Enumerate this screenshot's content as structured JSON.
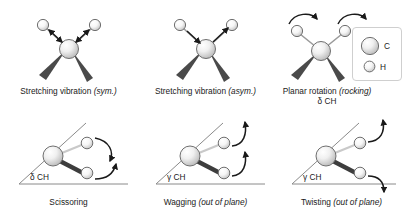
{
  "figure": {
    "background": "#ffffff"
  },
  "legend": {
    "name": "atom-legend",
    "items": [
      {
        "symbol": "C",
        "role": "carbon",
        "radius_px": 9,
        "color": "#e8e8e8"
      },
      {
        "symbol": "H",
        "role": "hydrogen",
        "radius_px": 5.5,
        "color": "#f2f2f2"
      }
    ]
  },
  "panels": [
    {
      "id": "stretching-sym",
      "caption_main": "Stretching vibration",
      "caption_italic": "(sym.)",
      "subcaption": "",
      "angle_label": "",
      "mode": "stretch",
      "arrow_style": "double-headed-straight",
      "arrow_direction": "in-phase"
    },
    {
      "id": "stretching-asym",
      "caption_main": "Stretching vibration",
      "caption_italic": "(asym.)",
      "subcaption": "",
      "angle_label": "",
      "mode": "stretch",
      "arrow_style": "single-headed-straight",
      "arrow_direction": "out-of-phase"
    },
    {
      "id": "planar-rotation-rocking",
      "caption_main": "Planar rotation",
      "caption_italic": "(rocking)",
      "subcaption": "δ CH",
      "angle_label": "",
      "mode": "rocking",
      "arrow_style": "curved",
      "arrow_direction": "same-direction"
    },
    {
      "id": "scissoring",
      "caption_main": "Scissoring",
      "caption_italic": "",
      "subcaption": "",
      "angle_label": "δ CH",
      "mode": "scissoring",
      "arrow_style": "curved",
      "arrow_direction": "converging"
    },
    {
      "id": "wagging",
      "caption_main": "Wagging",
      "caption_italic": "(out of plane)",
      "subcaption": "",
      "angle_label": "γ CH",
      "mode": "wagging",
      "arrow_style": "curved",
      "arrow_direction": "both-up"
    },
    {
      "id": "twisting",
      "caption_main": "Twisting",
      "caption_italic": "(out of plane)",
      "subcaption": "",
      "angle_label": "γ CH",
      "mode": "twisting",
      "arrow_style": "curved",
      "arrow_direction": "opposite"
    }
  ],
  "colors": {
    "atom_outline": "#6f6f6f",
    "bond_wedge": "#4a4a4a",
    "bond_line": "#9a9a9a",
    "arrow": "#1a1a1a",
    "plane_line": "#8a8a8a",
    "legend_border": "#cfcfcf"
  }
}
